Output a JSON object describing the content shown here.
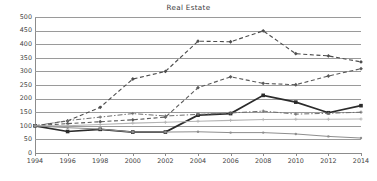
{
  "chart_data": {
    "type": "line",
    "title": "Real Estate",
    "xlabel": "",
    "ylabel": "",
    "x": [
      1994,
      1996,
      1998,
      2000,
      2002,
      2004,
      2006,
      2008,
      2010,
      2012,
      2014
    ],
    "categories": [
      "1994",
      "1996",
      "1998",
      "2000",
      "2002",
      "2004",
      "2006",
      "2008",
      "2010",
      "2012",
      "2014"
    ],
    "xlim": [
      1994,
      2014
    ],
    "ylim": [
      0,
      500
    ],
    "ytick_values": [
      0,
      50,
      100,
      150,
      200,
      250,
      300,
      350,
      400,
      450,
      500
    ],
    "ytick_labels": [
      "0",
      "50",
      "100",
      "150",
      "200",
      "250",
      "300",
      "350",
      "400",
      "450",
      "500"
    ],
    "xtick_labels": [
      "1994",
      "1996",
      "1998",
      "2000",
      "2002",
      "2004",
      "2006",
      "2008",
      "2010",
      "2012",
      "2014"
    ],
    "grid": true,
    "grid_axis": "y",
    "legend": "none",
    "series": [
      {
        "name": "series-1",
        "style": "dashed",
        "color": "#4d4d4d",
        "width": 1.1,
        "marker": "diamond",
        "values": [
          100,
          118,
          168,
          272,
          300,
          411,
          409,
          449,
          365,
          357,
          335
        ]
      },
      {
        "name": "series-2",
        "style": "dashed",
        "color": "#5a5a5a",
        "width": 1.1,
        "marker": "diamond",
        "values": [
          100,
          108,
          115,
          122,
          132,
          240,
          280,
          256,
          251,
          283,
          310
        ]
      },
      {
        "name": "series-3",
        "style": "solid",
        "color": "#2b2b2b",
        "width": 1.7,
        "marker": "square",
        "values": [
          100,
          79,
          87,
          77,
          77,
          139,
          145,
          212,
          187,
          148,
          174
        ]
      },
      {
        "name": "series-4",
        "style": "dash-dot",
        "color": "#6e6e6e",
        "width": 1.0,
        "marker": "tick",
        "values": [
          100,
          119,
          132,
          145,
          136,
          142,
          147,
          154,
          143,
          146,
          150
        ]
      },
      {
        "name": "series-5",
        "style": "solid",
        "color": "#b4b4b4",
        "width": 1.1,
        "marker": "plus",
        "values": [
          100,
          100,
          105,
          110,
          113,
          117,
          120,
          123,
          124,
          124,
          125
        ]
      },
      {
        "name": "series-6",
        "style": "solid",
        "color": "#8e8e8e",
        "width": 1.0,
        "marker": "dot",
        "values": [
          100,
          93,
          88,
          77,
          77,
          78,
          75,
          75,
          70,
          61,
          55
        ]
      }
    ]
  }
}
